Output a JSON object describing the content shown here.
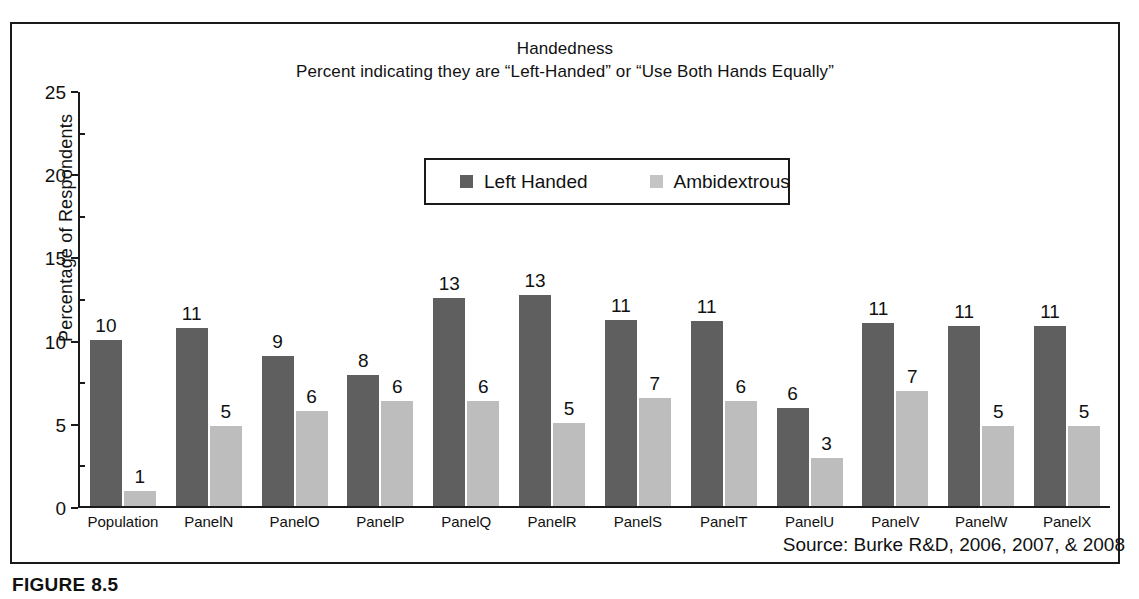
{
  "figure": {
    "caption": "FIGURE 8.5",
    "source_note": "Source: Burke R&D, 2006, 2007, & 2008"
  },
  "chart_data": {
    "type": "bar",
    "title": "Handedness",
    "subtitle": "Percent indicating they are “Left-Handed” or “Use Both Hands Equally”",
    "xlabel": "",
    "ylabel": "Percentage of Respondents",
    "ylim": [
      0,
      25
    ],
    "yticks": [
      0,
      5,
      10,
      15,
      20,
      25
    ],
    "ytick_labels": [
      "0",
      "5",
      "10",
      "15",
      "20",
      "25"
    ],
    "grid": false,
    "legend_position": "top-center",
    "categories": [
      "Population",
      "PanelN",
      "PanelO",
      "PanelP",
      "PanelQ",
      "PanelR",
      "PanelS",
      "PanelT",
      "PanelU",
      "PanelV",
      "PanelW",
      "PanelX"
    ],
    "series": [
      {
        "name": "Left Handed",
        "color": "#5f5f5f",
        "values": [
          10,
          11,
          9,
          8,
          13,
          13,
          11,
          11,
          6,
          11,
          11,
          11
        ],
        "plotted": [
          10.0,
          10.7,
          9.0,
          7.9,
          12.5,
          12.7,
          11.2,
          11.1,
          5.9,
          11.0,
          10.8,
          10.8
        ],
        "labels": [
          "10",
          "11",
          "9",
          "8",
          "13",
          "13",
          "11",
          "11",
          "6",
          "11",
          "11",
          "11"
        ]
      },
      {
        "name": "Ambidextrous",
        "color": "#bdbdbd",
        "values": [
          1,
          5,
          6,
          6,
          6,
          5,
          7,
          6,
          3,
          7,
          5,
          5
        ],
        "plotted": [
          0.9,
          4.8,
          5.7,
          6.3,
          6.3,
          5.0,
          6.5,
          6.3,
          2.9,
          6.9,
          4.8,
          4.8
        ],
        "labels": [
          "1",
          "5",
          "6",
          "6",
          "6",
          "5",
          "7",
          "6",
          "3",
          "7",
          "5",
          "5"
        ]
      }
    ]
  }
}
